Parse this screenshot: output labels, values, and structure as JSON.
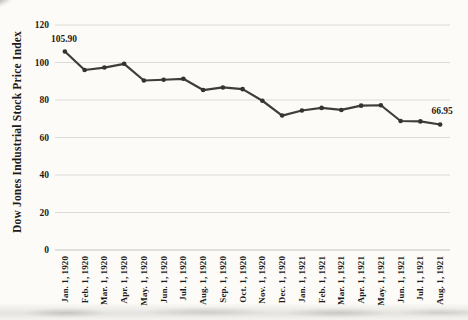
{
  "chart_data": {
    "type": "line",
    "title": "",
    "xlabel": "",
    "ylabel": "Dow Jones Industrial Stock Price Index",
    "categories": [
      "Jan. 1, 1920",
      "Feb. 1, 1920",
      "Mar. 1, 1920",
      "Apr. 1, 1920",
      "May. 1, 1920",
      "Jun. 1, 1920",
      "Jul. 1, 1920",
      "Aug. 1, 1920",
      "Sep. 1, 1920",
      "Oct. 1, 1920",
      "Nov. 1, 1920",
      "Dec. 1, 1920",
      "Jan. 1, 1921",
      "Feb. 1, 1921",
      "Mar. 1, 1921",
      "Apr. 1, 1921",
      "May. 1, 1921",
      "Jun. 1, 1921",
      "Jul. 1, 1921",
      "Aug. 1, 1921"
    ],
    "values": [
      105.9,
      96.0,
      97.3,
      99.3,
      90.4,
      90.8,
      91.3,
      85.3,
      86.7,
      85.8,
      79.6,
      71.7,
      74.4,
      75.8,
      74.7,
      77.0,
      77.2,
      68.8,
      68.6,
      66.95
    ],
    "yticks": [
      0,
      20,
      40,
      60,
      80,
      100,
      120
    ],
    "ylim": [
      0,
      120
    ],
    "grid": "horizontal-only",
    "legend_position": "none",
    "annotations": [
      {
        "index": 0,
        "text": "105.90"
      },
      {
        "index": 19,
        "text": "66.95"
      }
    ],
    "line_color": "#3e3d3b",
    "marker_color": "#34332f",
    "marker": "circle",
    "gridline_color": "#dcdad4",
    "axis_line_color": "#c6c3bd"
  }
}
